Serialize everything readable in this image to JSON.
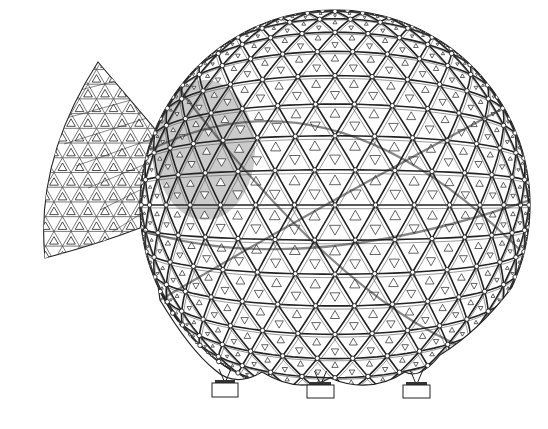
{
  "figure": {
    "background": "#ffffff",
    "stroke_color": "#222222",
    "stroke_light": "#555555",
    "fill_panel": "#ffffff",
    "sphere": {
      "cx": 335,
      "cy": 205,
      "r": 195,
      "bottom_y": 372
    },
    "wedge": {
      "apex": [
        98,
        62
      ],
      "left_base": [
        45,
        258
      ],
      "right_base": [
        160,
        135
      ],
      "arc_end": [
        140,
        228
      ]
    },
    "pedestals": [
      {
        "x": 212,
        "y": 383,
        "w": 26,
        "h": 14
      },
      {
        "x": 307,
        "y": 385,
        "w": 27,
        "h": 13
      },
      {
        "x": 403,
        "y": 385,
        "w": 27,
        "h": 13
      }
    ],
    "shaded_region": {
      "cx": 205,
      "cy": 150,
      "rx": 50,
      "ry": 70
    }
  }
}
